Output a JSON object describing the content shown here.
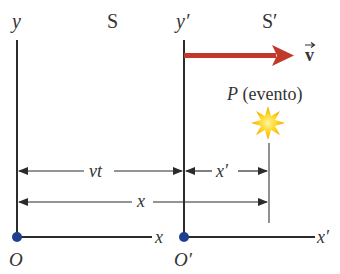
{
  "frames": {
    "S": {
      "name": "S",
      "y_axis": "y",
      "x_axis": "x",
      "origin": "O"
    },
    "S_prime": {
      "name": "S′",
      "y_axis": "y′",
      "x_axis": "x′",
      "origin": "O′"
    }
  },
  "velocity": {
    "label": "v",
    "color": "#c0392b"
  },
  "event": {
    "label_symbol": "P",
    "label_text": " (evento)",
    "color": "#f5b800"
  },
  "dimensions": {
    "vt": "vt",
    "x_prime": "x′",
    "x": "x"
  },
  "colors": {
    "axis": "#2b2b2b",
    "origin_dot": "#1f3f8f",
    "arrow": "#c0392b",
    "text": "#333333"
  }
}
